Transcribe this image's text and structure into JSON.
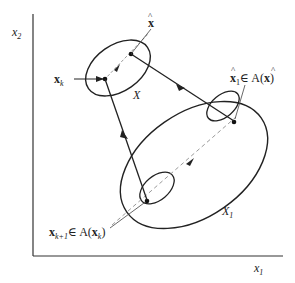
{
  "diagram": {
    "axes": {
      "x_label": "x",
      "x_label_sub": "1",
      "y_label": "x",
      "y_label_sub": "2"
    },
    "sets": {
      "small_set_label": "X",
      "large_set_label": "X",
      "large_set_label_sub": "1"
    },
    "points": {
      "xk_label": "x",
      "xk_sub": "k",
      "xhat_label": "x",
      "xhat_hat": "^",
      "xhat1_label": "x",
      "xhat1_sub": "1",
      "xhat1_in": "∈ A(",
      "xhat1_arg": "x",
      "xhat1_close": ")",
      "xk1_label": "x",
      "xk1_sub": "k+1",
      "xk1_in": "∈ A(",
      "xk1_arg": "x",
      "xk1_arg_sub": "k",
      "xk1_close": ")"
    },
    "colors": {
      "line": "#222222",
      "dashed": "#9a9a9a"
    }
  }
}
